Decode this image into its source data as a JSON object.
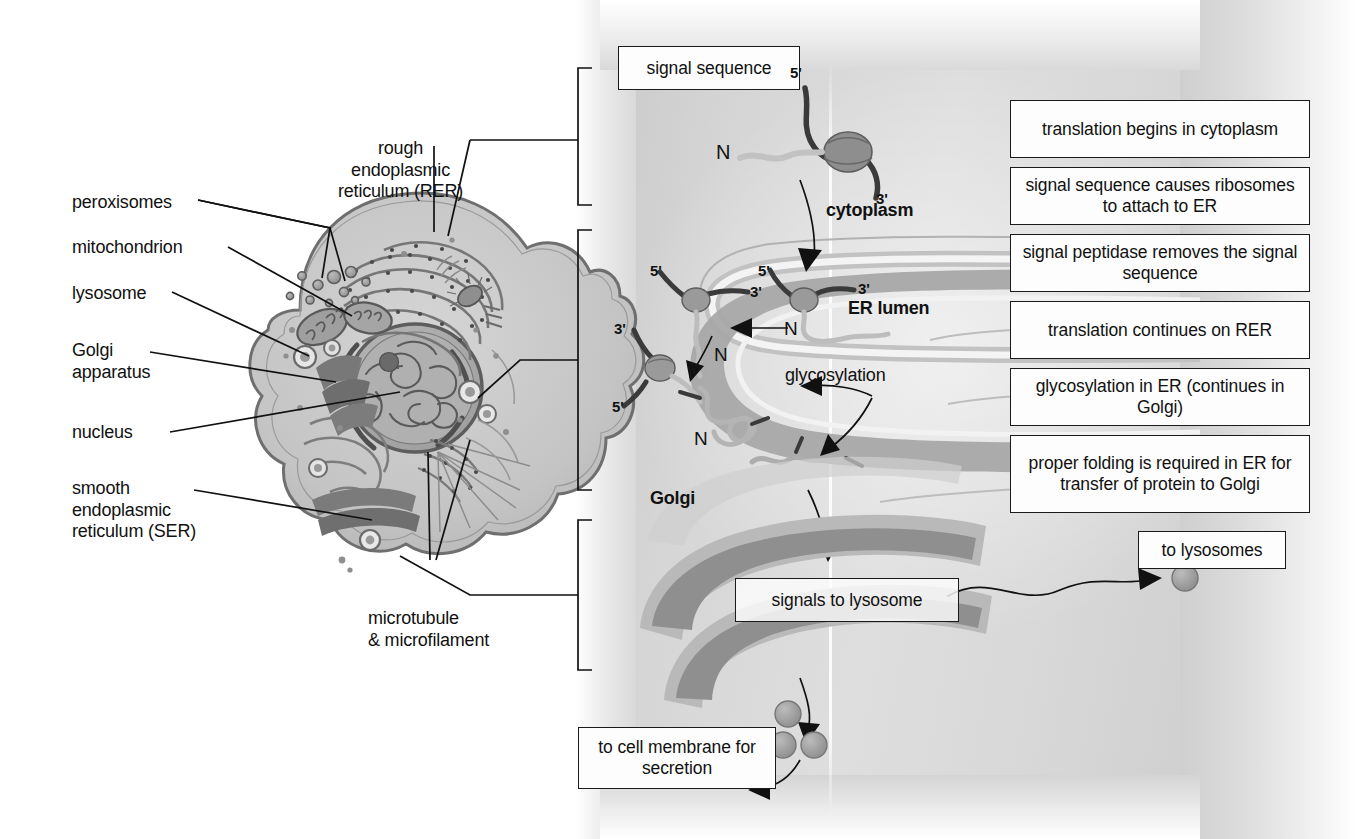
{
  "figure": {
    "domain": "biology-diagram"
  },
  "cell_labels": [
    {
      "id": "peroxisomes",
      "text": "peroxisomes"
    },
    {
      "id": "mitochondrion",
      "text": "mitochondrion"
    },
    {
      "id": "lysosome",
      "text": "lysosome"
    },
    {
      "id": "golgi",
      "text": "Golgi\napparatus"
    },
    {
      "id": "nucleus",
      "text": "nucleus"
    },
    {
      "id": "ser",
      "text": "smooth\nendoplasmic\nreticulum (SER)"
    },
    {
      "id": "rer",
      "text": "rough\nendoplasmic\nreticulum (RER)"
    },
    {
      "id": "cytoskeleton",
      "text": "microtubule\n& microfilament"
    }
  ],
  "pathway_boxes": [
    {
      "id": "signal-sequence",
      "text": "signal sequence"
    },
    {
      "id": "signals-lysosome",
      "text": "signals to lysosome"
    },
    {
      "id": "cell-membrane",
      "text": "to cell membrane\nfor secretion"
    },
    {
      "id": "to-lysosomes",
      "text": "to lysosomes"
    }
  ],
  "compartments": [
    {
      "id": "cytoplasm",
      "text": "cytoplasm"
    },
    {
      "id": "er-lumen",
      "text": "ER lumen"
    },
    {
      "id": "golgi",
      "text": "Golgi"
    }
  ],
  "molecule_labels": {
    "mrna_5prime": "5'",
    "mrna_3prime": "3'",
    "n_terminus": "N",
    "glycosylation": "glycosylation"
  },
  "steps": [
    {
      "n": 1,
      "text": "translation begins\nin cytoplasm"
    },
    {
      "n": 2,
      "text": "signal sequence causes\nribosomes to attach to ER"
    },
    {
      "n": 3,
      "text": "signal peptidase removes\nthe signal sequence"
    },
    {
      "n": 4,
      "text": "translation continues\non RER"
    },
    {
      "n": 5,
      "text": "glycosylation in ER\n(continues in Golgi)"
    },
    {
      "n": 6,
      "text": "proper folding is required\nin ER for transfer of\nprotein to Golgi"
    }
  ],
  "colors": {
    "ink": "#111111",
    "panel_light": "#dedede",
    "panel_dark": "#c9c9c9",
    "membrane_mid": "#a9a9a9",
    "membrane_dark": "#8a8a8a",
    "lumen": "#b8b8b8",
    "vesicle": "#9e9e9e",
    "box_fill": "#fdfdfd"
  }
}
